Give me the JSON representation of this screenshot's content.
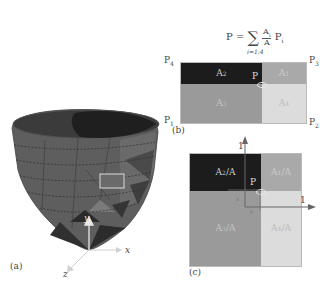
{
  "panel_a": {
    "label": "(a)",
    "axes": {
      "x": "x",
      "y": "y",
      "z": "z"
    },
    "colors": {
      "mesh_dark": "#3a3a3a",
      "mesh_mid": "#5c5c5c",
      "mesh_light": "#6e6e6e",
      "highlight": "#d9d9d9",
      "axis": "#e8e8e8"
    }
  },
  "panel_b": {
    "label": "(b)",
    "formula": {
      "lhs": "P =",
      "sum": "∑",
      "sum_index": "i=1:4",
      "numerator": "A",
      "numerator_sub": "i",
      "denominator": "A",
      "term": "P",
      "term_sub": "i"
    },
    "corners": {
      "p1": "P",
      "p1_sub": "1",
      "p2": "P",
      "p2_sub": "2",
      "p3": "P",
      "p3_sub": "3",
      "p4": "P",
      "p4_sub": "4"
    },
    "point": "P",
    "cells": [
      {
        "name": "A",
        "sub": "2",
        "color": "#1c1c1c"
      },
      {
        "name": "A",
        "sub": "1",
        "color": "#a9a9a9"
      },
      {
        "name": "A",
        "sub": "3",
        "color": "#9a9a9a"
      },
      {
        "name": "A",
        "sub": "4",
        "color": "#dcdcdc"
      }
    ]
  },
  "panel_c": {
    "label": "(c)",
    "axis_ticks": {
      "vertical": "1",
      "horizontal": "1"
    },
    "local_coords": {
      "s": "s",
      "r": "r"
    },
    "point": "P",
    "cells": [
      {
        "name": "A",
        "sub": "2",
        "suffix": "/A",
        "color": "#1c1c1c"
      },
      {
        "name": "A",
        "sub": "1",
        "suffix": "/A",
        "color": "#a9a9a9"
      },
      {
        "name": "A",
        "sub": "3",
        "suffix": "/A",
        "color": "#9a9a9a"
      },
      {
        "name": "A",
        "sub": "4",
        "suffix": "/A",
        "color": "#dcdcdc"
      }
    ]
  }
}
